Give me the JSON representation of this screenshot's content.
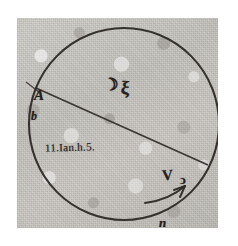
{
  "image": {
    "kind": "scanned-manuscript-diagram",
    "subject": "circle-with-chord-and-rotation-arrow",
    "paper_color": "#c9c7c2",
    "ink_color": "#24211e",
    "background_color": "#ffffff"
  },
  "diagram": {
    "circle": {
      "name": "main-circle",
      "center_x": 124,
      "center_y": 124,
      "radius": 95
    },
    "chord": {
      "name": "chord-A-B",
      "from": {
        "point": "A",
        "x": 37,
        "y": 88
      },
      "to": {
        "point": "B",
        "x": 208,
        "y": 165
      }
    },
    "rotation_arrow": {
      "name": "rotation-arrow",
      "direction": "counter-clockwise-upward-right",
      "label": "n"
    },
    "margin_rule": {
      "name": "left-margin-rule",
      "x": 22
    }
  },
  "labels": {
    "point_a": "A",
    "point_b_right": "B",
    "point_b_left": "b",
    "date_note": "11.Ian.h.5.",
    "moon_symbol": "☽",
    "xi_symbol": "ξ",
    "letter_v": "V",
    "loop_symbol": "ↄ",
    "motion_letter": "n"
  }
}
